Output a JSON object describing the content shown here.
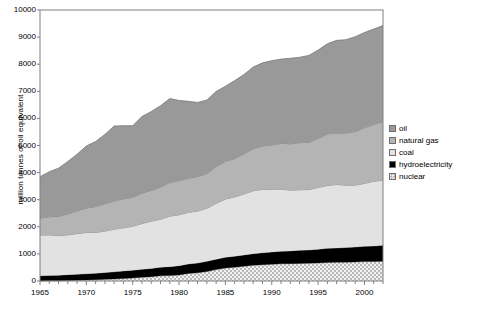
{
  "chart_data": {
    "type": "area",
    "stacked": true,
    "title": "",
    "subtitle": "",
    "xlabel": "",
    "ylabel": "million tonnes of oil equivalent",
    "xlim": [
      1965,
      2002
    ],
    "ylim": [
      0,
      10000
    ],
    "y_ticks": [
      0,
      1000,
      2000,
      3000,
      4000,
      5000,
      6000,
      7000,
      8000,
      9000,
      10000
    ],
    "y_tick_labels": [
      "0",
      "1000",
      "2000",
      "3000",
      "4000",
      "5000",
      "6000",
      "7000",
      "8000",
      "9000",
      "10000"
    ],
    "x_ticks": [
      1965,
      1970,
      1975,
      1980,
      1985,
      1990,
      1995,
      2000
    ],
    "x_tick_labels": [
      "1965",
      "1970",
      "1975",
      "1980",
      "1985",
      "1990",
      "1995",
      "2000"
    ],
    "x_minor_tick_interval": 1,
    "grid": false,
    "legend_position": "right",
    "x": [
      1965,
      1966,
      1967,
      1968,
      1969,
      1970,
      1971,
      1972,
      1973,
      1974,
      1975,
      1976,
      1977,
      1978,
      1979,
      1980,
      1981,
      1982,
      1983,
      1984,
      1985,
      1986,
      1987,
      1988,
      1989,
      1990,
      1991,
      1992,
      1993,
      1994,
      1995,
      1996,
      1997,
      1998,
      1999,
      2000,
      2001,
      2002
    ],
    "stack_order_bottom_to_top": [
      "nuclear",
      "hydroelectricity",
      "coal",
      "natural gas",
      "oil"
    ],
    "series": [
      {
        "name": "nuclear",
        "color": "#d0d0d0",
        "pattern": "checker",
        "values": [
          0,
          5,
          10,
          18,
          25,
          35,
          45,
          60,
          75,
          90,
          110,
          135,
          160,
          190,
          200,
          225,
          280,
          305,
          350,
          420,
          480,
          510,
          545,
          580,
          600,
          615,
          635,
          640,
          650,
          655,
          665,
          685,
          690,
          695,
          705,
          715,
          720,
          725
        ]
      },
      {
        "name": "hydroelectricity",
        "color": "#000000",
        "pattern": "solid",
        "values": [
          195,
          200,
          205,
          215,
          225,
          235,
          240,
          250,
          265,
          280,
          290,
          295,
          305,
          320,
          330,
          340,
          350,
          355,
          375,
          385,
          395,
          405,
          415,
          430,
          440,
          455,
          465,
          470,
          485,
          490,
          505,
          520,
          530,
          540,
          550,
          565,
          570,
          590
        ]
      },
      {
        "name": "coal",
        "color": "#e2e2e2",
        "pattern": "solid",
        "values": [
          1500,
          1495,
          1455,
          1470,
          1500,
          1520,
          1505,
          1530,
          1570,
          1590,
          1620,
          1690,
          1740,
          1770,
          1860,
          1880,
          1900,
          1920,
          1960,
          2060,
          2150,
          2190,
          2250,
          2320,
          2340,
          2310,
          2290,
          2240,
          2230,
          2230,
          2280,
          2320,
          2340,
          2300,
          2280,
          2320,
          2390,
          2400
        ]
      },
      {
        "name": "natural gas",
        "color": "#b4b4b4",
        "pattern": "solid",
        "values": [
          625,
          670,
          715,
          775,
          840,
          900,
          960,
          1010,
          1050,
          1070,
          1070,
          1120,
          1140,
          1180,
          1250,
          1260,
          1260,
          1270,
          1280,
          1360,
          1390,
          1410,
          1480,
          1545,
          1600,
          1640,
          1690,
          1710,
          1740,
          1740,
          1810,
          1900,
          1900,
          1930,
          1980,
          2060,
          2100,
          2160
        ]
      },
      {
        "name": "oil",
        "color": "#999999",
        "pattern": "solid",
        "values": [
          1530,
          1660,
          1780,
          1930,
          2090,
          2290,
          2400,
          2560,
          2760,
          2700,
          2640,
          2830,
          2910,
          3010,
          3090,
          2960,
          2840,
          2740,
          2710,
          2770,
          2770,
          2880,
          2930,
          3020,
          3070,
          3110,
          3110,
          3160,
          3150,
          3210,
          3260,
          3330,
          3420,
          3440,
          3500,
          3510,
          3520,
          3550
        ]
      }
    ],
    "legend_entries": [
      {
        "label": "oil",
        "color": "#999999",
        "pattern": "solid"
      },
      {
        "label": "natural gas",
        "color": "#b4b4b4",
        "pattern": "solid"
      },
      {
        "label": "coal",
        "color": "#e2e2e2",
        "pattern": "solid"
      },
      {
        "label": "hydroelectricity",
        "color": "#000000",
        "pattern": "solid"
      },
      {
        "label": "nuclear",
        "color": "#d0d0d0",
        "pattern": "checker"
      }
    ]
  },
  "colors": {
    "axis": "#808080",
    "plot_border": "#808080",
    "text": "#000000",
    "background": "#ffffff",
    "series_outline": "#6e6e6e"
  }
}
